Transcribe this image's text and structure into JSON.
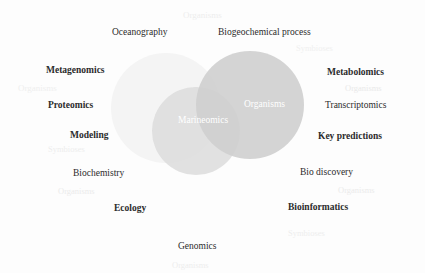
{
  "figure": {
    "kind": "venn-diagram",
    "background_color": "#fdfdfd",
    "label_color": "#2b2b2b",
    "watermark_color": "#ececec",
    "incircle_text_color": "#ffffff"
  },
  "circles": [
    {
      "name": "top-left-circle",
      "cx": 166,
      "cy": 108,
      "r": 55,
      "fill": "#f4f4f4",
      "opacity": 0.9
    },
    {
      "name": "bottom-left-circle",
      "cx": 196,
      "cy": 131,
      "r": 44,
      "fill": "#dcdcdc",
      "opacity": 0.85
    },
    {
      "name": "right-circle",
      "cx": 250,
      "cy": 105,
      "r": 54,
      "fill": "#cfcfcf",
      "opacity": 0.9
    }
  ],
  "inner_labels": [
    {
      "text": "Organisms",
      "x": 244,
      "y": 100,
      "size": 9.5
    },
    {
      "text": "Marineomics",
      "x": 178,
      "y": 116,
      "size": 9.5
    }
  ],
  "labels": [
    {
      "text": "Oceanography",
      "x": 112,
      "y": 28,
      "size": 9.5,
      "bold": false
    },
    {
      "text": "Biogeochemical process",
      "x": 218,
      "y": 28,
      "size": 9.5,
      "bold": false
    },
    {
      "text": "Metagenomics",
      "x": 46,
      "y": 66,
      "size": 9.5,
      "bold": true
    },
    {
      "text": "Metabolomics",
      "x": 327,
      "y": 68,
      "size": 9.5,
      "bold": true
    },
    {
      "text": "Proteomics",
      "x": 48,
      "y": 101,
      "size": 9.5,
      "bold": true
    },
    {
      "text": "Transcriptomics",
      "x": 325,
      "y": 101,
      "size": 9.5,
      "bold": false
    },
    {
      "text": "Modeling",
      "x": 70,
      "y": 131,
      "size": 9.5,
      "bold": true
    },
    {
      "text": "Key predictions",
      "x": 318,
      "y": 132,
      "size": 9.5,
      "bold": true
    },
    {
      "text": "Biochemistry",
      "x": 73,
      "y": 169,
      "size": 9.5,
      "bold": false
    },
    {
      "text": "Bio discovery",
      "x": 300,
      "y": 168,
      "size": 9.5,
      "bold": false
    },
    {
      "text": "Ecology",
      "x": 114,
      "y": 204,
      "size": 9.5,
      "bold": true
    },
    {
      "text": "Bioinformatics",
      "x": 288,
      "y": 203,
      "size": 9.5,
      "bold": true
    },
    {
      "text": "Genomics",
      "x": 178,
      "y": 242,
      "size": 9.5,
      "bold": false
    }
  ],
  "watermarks": [
    {
      "text": "Organisms",
      "x": 183,
      "y": 11,
      "size": 9,
      "color": "#ededed"
    },
    {
      "text": "Symbioses",
      "x": 296,
      "y": 44,
      "size": 8.5,
      "color": "#f0f0f0"
    },
    {
      "text": "Organisms",
      "x": 18,
      "y": 84,
      "size": 9,
      "color": "#efefef"
    },
    {
      "text": "Organisms",
      "x": 345,
      "y": 84,
      "size": 8.5,
      "color": "#e9e9e9"
    },
    {
      "text": "Symbioses",
      "x": 48,
      "y": 145,
      "size": 8.5,
      "color": "#ededed"
    },
    {
      "text": "Organisms",
      "x": 58,
      "y": 187,
      "size": 8.5,
      "color": "#ebebeb"
    },
    {
      "text": "Organisms",
      "x": 338,
      "y": 186,
      "size": 8.5,
      "color": "#ebebeb"
    },
    {
      "text": "Symbioses",
      "x": 288,
      "y": 229,
      "size": 8.5,
      "color": "#eeeeee"
    },
    {
      "text": "Organisms",
      "x": 172,
      "y": 261,
      "size": 8.5,
      "color": "#ededed"
    }
  ]
}
